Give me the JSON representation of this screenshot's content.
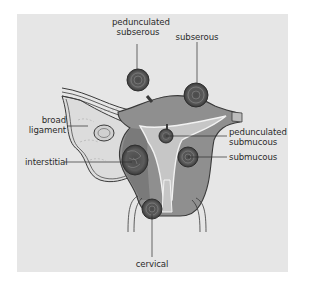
{
  "figure": {
    "colors": {
      "background": "#e6e6e6",
      "uterus_wall": "#8f8f8f",
      "uterus_dark": "#6e6e6e",
      "cavity": "#c4c4c4",
      "outline": "#3a3a3a",
      "fibroid": "#5a5a5a",
      "ligament": "#d9d9d9"
    },
    "labels": {
      "pedunculated_subserous_line1": "pedunculated",
      "pedunculated_subserous_line2": "subserous",
      "subserous": "subserous",
      "broad_ligament_line1": "broad",
      "broad_ligament_line2": "ligament",
      "pedunculated_submucous_line1": "pedunculated",
      "pedunculated_submucous_line2": "submucous",
      "interstitial": "interstitial",
      "submucous": "submucous",
      "cervical": "cervical"
    }
  }
}
